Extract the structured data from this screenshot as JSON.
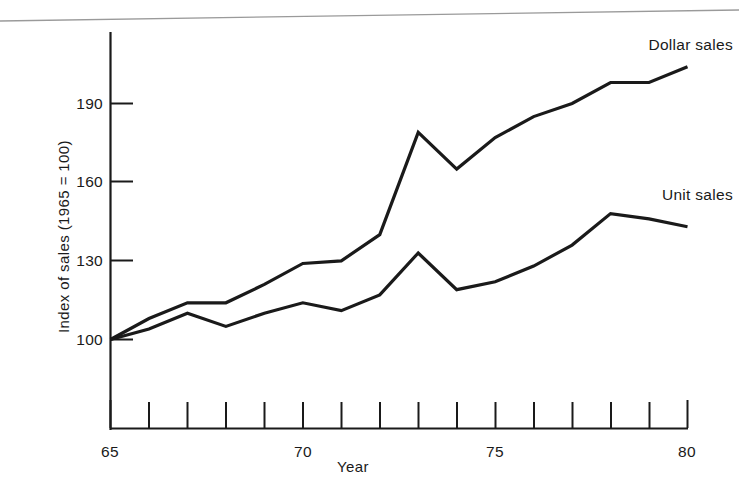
{
  "figure": {
    "background_color": "#ffffff",
    "line_color": "#1a1a1a"
  },
  "axes": {
    "xlabel": "Year",
    "ylabel": "Index of sales (1965 = 100)",
    "x_tick_labels": [
      "65",
      "70",
      "75",
      "80"
    ],
    "x_tick_label_years": [
      65,
      70,
      75,
      80
    ],
    "y_tick_labels": [
      "100",
      "130",
      "160",
      "190"
    ],
    "y_tick_values": [
      100,
      130,
      160,
      190
    ],
    "x_minor_tick_years": [
      65,
      66,
      67,
      68,
      69,
      70,
      71,
      72,
      73,
      74,
      75,
      76,
      77,
      78,
      79,
      80
    ]
  },
  "legend": {
    "dollar_label": "Dollar sales",
    "unit_label": "Unit sales"
  },
  "chart_data": {
    "type": "line",
    "title": "",
    "subtitle": "",
    "xlabel": "Year",
    "ylabel": "Index of sales (1965 = 100)",
    "xlim": [
      65,
      80
    ],
    "ylim": [
      90,
      210
    ],
    "grid": false,
    "legend_position": "inline-right-of-series",
    "x": [
      65,
      66,
      67,
      68,
      69,
      70,
      71,
      72,
      73,
      74,
      75,
      76,
      77,
      78,
      79,
      80
    ],
    "x_tick_labels": [
      "65",
      "70",
      "75",
      "80"
    ],
    "y_ticks": [
      100,
      130,
      160,
      190
    ],
    "series": [
      {
        "name": "Dollar sales",
        "values": [
          100,
          108,
          114,
          114,
          121,
          129,
          130,
          140,
          179,
          165,
          177,
          185,
          190,
          198,
          198,
          204
        ]
      },
      {
        "name": "Unit sales",
        "values": [
          100,
          104,
          110,
          105,
          110,
          114,
          111,
          117,
          133,
          119,
          122,
          128,
          136,
          148,
          146,
          143
        ]
      }
    ],
    "annotations": [
      {
        "text": "Dollar sales",
        "x": 79.2,
        "y": 208
      },
      {
        "text": "Unit sales",
        "x": 79.2,
        "y": 158
      }
    ]
  }
}
